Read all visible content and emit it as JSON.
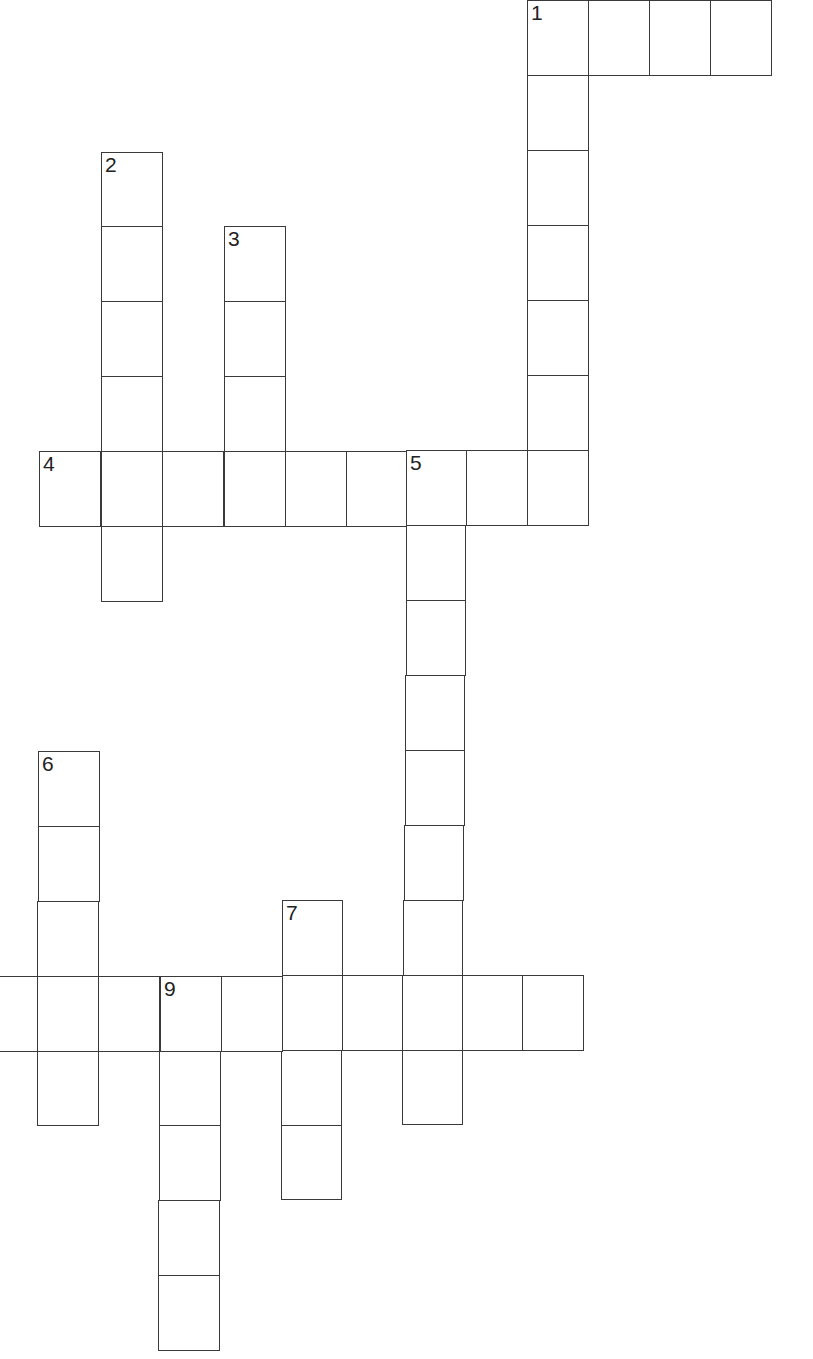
{
  "puzzle": {
    "type": "crossword",
    "colors": {
      "line": "#3a3a3a",
      "number": "#222222",
      "background": "#ffffff"
    },
    "clue_numbers": [
      "1",
      "2",
      "3",
      "4",
      "5",
      "6",
      "7",
      "9"
    ],
    "words": [
      {
        "number": "1",
        "direction": "across",
        "length": 4
      },
      {
        "number": "1",
        "direction": "down",
        "length": 7
      },
      {
        "number": "2",
        "direction": "down",
        "length": 6
      },
      {
        "number": "3",
        "direction": "down",
        "length": 4
      },
      {
        "number": "4",
        "direction": "across",
        "length": 9
      },
      {
        "number": "5",
        "direction": "down",
        "length": 9
      },
      {
        "number": "6",
        "direction": "down",
        "length": 5
      },
      {
        "number": "7",
        "direction": "down",
        "length": 4
      },
      {
        "number": "8",
        "direction": "across",
        "length": 10,
        "note": "label cut off at left edge"
      },
      {
        "number": "9",
        "direction": "down",
        "length": 5
      }
    ],
    "cells": [
      {
        "x": 527,
        "y": 0,
        "w": 62,
        "h": 76,
        "n": "1"
      },
      {
        "x": 588,
        "y": 0,
        "w": 62,
        "h": 76
      },
      {
        "x": 649,
        "y": 0,
        "w": 62,
        "h": 76
      },
      {
        "x": 710,
        "y": 0,
        "w": 62,
        "h": 76
      },
      {
        "x": 527,
        "y": 75,
        "w": 62,
        "h": 76
      },
      {
        "x": 527,
        "y": 150,
        "w": 62,
        "h": 76
      },
      {
        "x": 527,
        "y": 225,
        "w": 62,
        "h": 76
      },
      {
        "x": 527,
        "y": 300,
        "w": 62,
        "h": 76
      },
      {
        "x": 527,
        "y": 375,
        "w": 62,
        "h": 76
      },
      {
        "x": 101,
        "y": 152,
        "w": 62,
        "h": 75,
        "n": "2"
      },
      {
        "x": 101,
        "y": 226,
        "w": 62,
        "h": 76
      },
      {
        "x": 101,
        "y": 301,
        "w": 62,
        "h": 76
      },
      {
        "x": 101,
        "y": 376,
        "w": 62,
        "h": 76
      },
      {
        "x": 101,
        "y": 525,
        "w": 62,
        "h": 77
      },
      {
        "x": 224,
        "y": 226,
        "w": 62,
        "h": 76,
        "n": "3"
      },
      {
        "x": 224,
        "y": 301,
        "w": 62,
        "h": 76
      },
      {
        "x": 224,
        "y": 376,
        "w": 62,
        "h": 76
      },
      {
        "x": 39,
        "y": 451,
        "w": 62,
        "h": 76,
        "n": "4"
      },
      {
        "x": 101,
        "y": 451,
        "w": 62,
        "h": 76
      },
      {
        "x": 162,
        "y": 451,
        "w": 62,
        "h": 76
      },
      {
        "x": 224,
        "y": 451,
        "w": 62,
        "h": 76
      },
      {
        "x": 285,
        "y": 451,
        "w": 62,
        "h": 76
      },
      {
        "x": 346,
        "y": 451,
        "w": 61,
        "h": 76
      },
      {
        "x": 406,
        "y": 450,
        "w": 61,
        "h": 76,
        "n": "5"
      },
      {
        "x": 466,
        "y": 450,
        "w": 62,
        "h": 76
      },
      {
        "x": 527,
        "y": 450,
        "w": 62,
        "h": 76
      },
      {
        "x": 406,
        "y": 525,
        "w": 60,
        "h": 76
      },
      {
        "x": 406,
        "y": 600,
        "w": 60,
        "h": 76
      },
      {
        "x": 405,
        "y": 675,
        "w": 60,
        "h": 76
      },
      {
        "x": 405,
        "y": 750,
        "w": 60,
        "h": 76
      },
      {
        "x": 404,
        "y": 825,
        "w": 60,
        "h": 76
      },
      {
        "x": 403,
        "y": 900,
        "w": 60,
        "h": 76
      },
      {
        "x": 402,
        "y": 1050,
        "w": 61,
        "h": 75
      },
      {
        "x": 38,
        "y": 751,
        "w": 62,
        "h": 76,
        "n": "6"
      },
      {
        "x": 38,
        "y": 826,
        "w": 62,
        "h": 76
      },
      {
        "x": 37,
        "y": 901,
        "w": 62,
        "h": 76
      },
      {
        "x": 37,
        "y": 1051,
        "w": 62,
        "h": 75
      },
      {
        "x": 282,
        "y": 900,
        "w": 61,
        "h": 76,
        "n": "7"
      },
      {
        "x": 281,
        "y": 1050,
        "w": 61,
        "h": 76
      },
      {
        "x": 281,
        "y": 1125,
        "w": 61,
        "h": 75
      },
      {
        "x": -24,
        "y": 976,
        "w": 62,
        "h": 76
      },
      {
        "x": 37,
        "y": 976,
        "w": 62,
        "h": 76
      },
      {
        "x": 98,
        "y": 976,
        "w": 62,
        "h": 76
      },
      {
        "x": 160,
        "y": 976,
        "w": 62,
        "h": 76,
        "n": "9"
      },
      {
        "x": 221,
        "y": 976,
        "w": 62,
        "h": 76
      },
      {
        "x": 282,
        "y": 975,
        "w": 61,
        "h": 76
      },
      {
        "x": 342,
        "y": 975,
        "w": 61,
        "h": 76
      },
      {
        "x": 402,
        "y": 975,
        "w": 61,
        "h": 76
      },
      {
        "x": 462,
        "y": 975,
        "w": 61,
        "h": 76
      },
      {
        "x": 522,
        "y": 975,
        "w": 62,
        "h": 76
      },
      {
        "x": 159,
        "y": 1051,
        "w": 62,
        "h": 75
      },
      {
        "x": 159,
        "y": 1125,
        "w": 62,
        "h": 76
      },
      {
        "x": 158,
        "y": 1200,
        "w": 62,
        "h": 76
      },
      {
        "x": 158,
        "y": 1275,
        "w": 62,
        "h": 76
      }
    ]
  }
}
